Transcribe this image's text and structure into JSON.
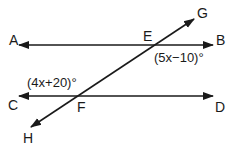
{
  "diagram": {
    "type": "parallel-lines-transversal",
    "colors": {
      "stroke": "#1a1a1a",
      "background": "#ffffff"
    },
    "lines": [
      {
        "id": "AB",
        "from": "A",
        "to": "B"
      },
      {
        "id": "CD",
        "from": "C",
        "to": "D"
      },
      {
        "id": "GH",
        "from": "G",
        "to": "H",
        "description": "transversal"
      }
    ],
    "points": {
      "A": "A",
      "B": "B",
      "C": "C",
      "D": "D",
      "E": "E",
      "F": "F",
      "G": "G",
      "H": "H"
    },
    "angles": {
      "at_E": "(5x−10)°",
      "at_F": "(4x+20)°"
    }
  }
}
